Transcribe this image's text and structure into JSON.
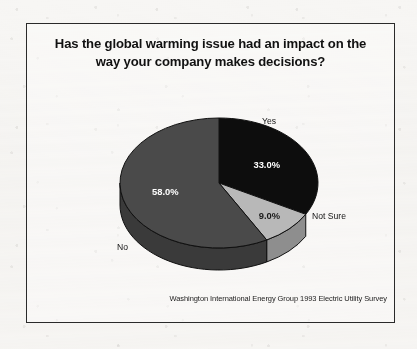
{
  "figure": {
    "title_line_1": "Has the global warming issue had an impact on the",
    "title_line_2": "way your company makes decisions?",
    "source_note": "Washington International Energy Group 1993 Electric Utility Survey",
    "frame_color": "#2a2a2a",
    "paper_color": "#f7f6f4"
  },
  "chart_data": {
    "type": "pie",
    "title": "Has the global warming issue had an impact on the way your company makes decisions?",
    "subtitle": "",
    "xlabel": "",
    "ylabel": "",
    "legend_position": "none",
    "grid": false,
    "three_d": true,
    "start_angle_deg": -90,
    "direction": "clockwise",
    "categories": [
      "Yes",
      "Not Sure",
      "No"
    ],
    "values": [
      33.0,
      9.0,
      58.0
    ],
    "value_labels": [
      "33.0%",
      "9.0%",
      "58.0%"
    ],
    "colors": [
      "#0d0d0d",
      "#b8b8b8",
      "#4a4a4a"
    ],
    "side_colors": [
      "#000000",
      "#8e8e8e",
      "#3a3a3a"
    ],
    "label_text_colors": [
      "#ffffff",
      "#1a1a1a",
      "#ffffff"
    ],
    "annotations": [
      {
        "text": "Yes",
        "x": 262,
        "y": 121
      },
      {
        "text": "Not Sure",
        "x": 312,
        "y": 216
      },
      {
        "text": "No",
        "x": 117,
        "y": 247
      }
    ]
  },
  "pie_geometry": {
    "center_x": 193,
    "center_y": 160,
    "radius_x": 99,
    "radius_y": 65,
    "depth": 22
  },
  "labels": {
    "yes": "Yes",
    "not_sure": "Not Sure",
    "no": "No",
    "yes_pct": "33.0%",
    "not_sure_pct": "9.0%",
    "no_pct": "58.0%"
  }
}
